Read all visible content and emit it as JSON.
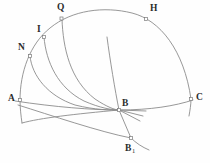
{
  "figure": {
    "background_color": "#fefefe",
    "stroke_color": "#8c8c8c",
    "label_color": "#2b2b2b",
    "marker_style": "small-open-square",
    "width": 210,
    "height": 163,
    "points": [
      {
        "id": "Q",
        "label": "Q",
        "label_sub": "",
        "marker_x": 62,
        "marker_y": 19,
        "label_x": 57,
        "label_y": 3
      },
      {
        "id": "H",
        "label": "H",
        "label_sub": "",
        "marker_x": 146,
        "marker_y": 19,
        "label_x": 150,
        "label_y": 4
      },
      {
        "id": "I",
        "label": "I",
        "label_sub": "",
        "marker_x": 44,
        "marker_y": 37,
        "label_x": 37,
        "label_y": 25
      },
      {
        "id": "N",
        "label": "N",
        "label_sub": "",
        "marker_x": 30,
        "marker_y": 56,
        "label_x": 18,
        "label_y": 43
      },
      {
        "id": "A",
        "label": "A",
        "label_sub": "",
        "marker_x": 20,
        "marker_y": 100,
        "label_x": 8,
        "label_y": 94
      },
      {
        "id": "C",
        "label": "C",
        "label_sub": "",
        "marker_x": 191,
        "marker_y": 99,
        "label_x": 196,
        "label_y": 93
      },
      {
        "id": "B",
        "label": "B",
        "label_sub": "",
        "marker_x": 119,
        "marker_y": 110,
        "label_x": 122,
        "label_y": 99
      },
      {
        "id": "B1",
        "label": "B",
        "label_sub": "1",
        "marker_x": 131,
        "marker_y": 138,
        "label_x": 125,
        "label_y": 144
      }
    ],
    "curves": [
      {
        "id": "main-arc",
        "name": "circumscribed-arc-through-A-N-I-Q-H-C"
      },
      {
        "id": "chord-AC",
        "name": "chord-A-to-C-through-B"
      },
      {
        "id": "curve-N-B",
        "name": "arc-from-N-to-B"
      },
      {
        "id": "curve-I-B",
        "name": "arc-from-I-to-B"
      },
      {
        "id": "curve-Q-B",
        "name": "arc-from-Q-to-B"
      },
      {
        "id": "line-vert-B",
        "name": "near-vertical-line-through-B-to-B1"
      },
      {
        "id": "line-A-B1",
        "name": "line-from-A-region-to-B1"
      },
      {
        "id": "ray-B-1",
        "name": "short-ray-from-B-lower-right"
      },
      {
        "id": "ray-B-2",
        "name": "short-ray-from-B-lower-right-2"
      },
      {
        "id": "arc-tail-A",
        "name": "arc-tail-below-A"
      },
      {
        "id": "arc-tail-C",
        "name": "arc-tail-below-C"
      }
    ]
  }
}
